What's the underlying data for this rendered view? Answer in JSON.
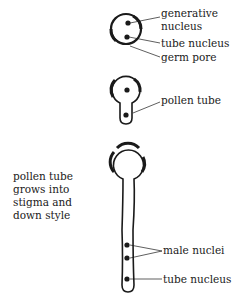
{
  "diagram": {
    "stage1": {
      "labels": {
        "generative_nucleus_line1": "generative",
        "generative_nucleus_line2": "nucleus",
        "tube_nucleus": "tube nucleus",
        "germ_pore": "germ pore"
      }
    },
    "stage2": {
      "labels": {
        "pollen_tube": "pollen tube"
      }
    },
    "stage3": {
      "labels": {
        "male_nuclei": "male nuclei",
        "tube_nucleus": "tube nucleus"
      },
      "caption": [
        "pollen tube",
        "grows into",
        "stigma and",
        "down style"
      ]
    },
    "colors": {
      "ink": "#1a1a1a",
      "background": "#ffffff"
    }
  }
}
